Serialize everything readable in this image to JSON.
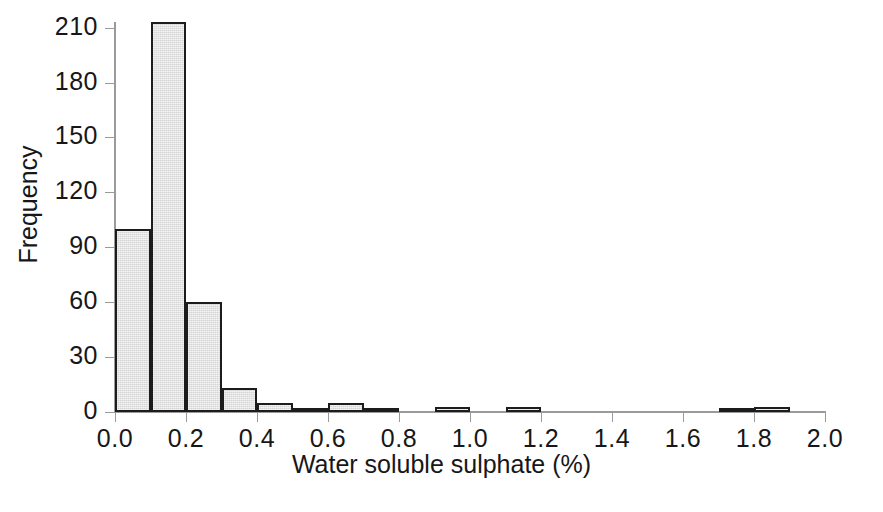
{
  "chart_data": {
    "type": "bar",
    "title": "",
    "subtitle": "",
    "xlabel": "Water soluble sulphate (%)",
    "ylabel": "Frequency",
    "xlim": [
      0.0,
      2.0
    ],
    "ylim": [
      0,
      212
    ],
    "grid": false,
    "legend": null,
    "bin_width": 0.1,
    "x_tick_labels": [
      "0.0",
      "0.2",
      "0.4",
      "0.6",
      "0.8",
      "1.0",
      "1.2",
      "1.4",
      "1.6",
      "1.8",
      "2.0"
    ],
    "x_tick_values": [
      0.0,
      0.2,
      0.4,
      0.6,
      0.8,
      1.0,
      1.2,
      1.4,
      1.6,
      1.8,
      2.0
    ],
    "y_tick_labels": [
      "0",
      "30",
      "60",
      "90",
      "120",
      "150",
      "180",
      "210"
    ],
    "y_tick_values": [
      0,
      30,
      60,
      90,
      120,
      150,
      180,
      210
    ],
    "bins": [
      {
        "start": 0.0,
        "end": 0.1,
        "value": 100
      },
      {
        "start": 0.1,
        "end": 0.2,
        "value": 213
      },
      {
        "start": 0.2,
        "end": 0.3,
        "value": 60
      },
      {
        "start": 0.3,
        "end": 0.4,
        "value": 13
      },
      {
        "start": 0.4,
        "end": 0.5,
        "value": 5
      },
      {
        "start": 0.5,
        "end": 0.6,
        "value": 2
      },
      {
        "start": 0.6,
        "end": 0.7,
        "value": 5
      },
      {
        "start": 0.7,
        "end": 0.8,
        "value": 2
      },
      {
        "start": 0.8,
        "end": 0.9,
        "value": 0
      },
      {
        "start": 0.9,
        "end": 1.0,
        "value": 3
      },
      {
        "start": 1.0,
        "end": 1.1,
        "value": 0
      },
      {
        "start": 1.1,
        "end": 1.2,
        "value": 3
      },
      {
        "start": 1.2,
        "end": 1.3,
        "value": 0
      },
      {
        "start": 1.3,
        "end": 1.4,
        "value": 0
      },
      {
        "start": 1.4,
        "end": 1.5,
        "value": 0
      },
      {
        "start": 1.5,
        "end": 1.6,
        "value": 0
      },
      {
        "start": 1.6,
        "end": 1.7,
        "value": 0
      },
      {
        "start": 1.7,
        "end": 1.8,
        "value": 1
      },
      {
        "start": 1.8,
        "end": 1.9,
        "value": 3
      },
      {
        "start": 1.9,
        "end": 2.0,
        "value": 0
      }
    ],
    "categories": [
      "0.0-0.1",
      "0.1-0.2",
      "0.2-0.3",
      "0.3-0.4",
      "0.4-0.5",
      "0.5-0.6",
      "0.6-0.7",
      "0.7-0.8",
      "0.8-0.9",
      "0.9-1.0",
      "1.0-1.1",
      "1.1-1.2",
      "1.2-1.3",
      "1.3-1.4",
      "1.4-1.5",
      "1.5-1.6",
      "1.6-1.7",
      "1.7-1.8",
      "1.8-1.9",
      "1.9-2.0"
    ],
    "values": [
      100,
      213,
      60,
      13,
      5,
      2,
      5,
      2,
      0,
      3,
      0,
      3,
      0,
      0,
      0,
      0,
      0,
      1,
      3,
      0
    ],
    "colors": {
      "bar_fill": "#d4d4d4",
      "bar_edge": "#1c1c1c",
      "axis": "#9a9a9a",
      "text": "#171717",
      "background": "#ffffff"
    }
  }
}
